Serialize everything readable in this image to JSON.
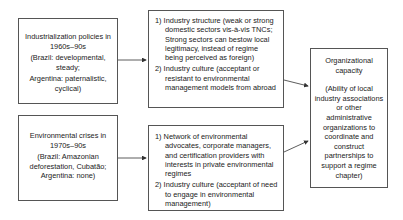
{
  "diagram": {
    "box_industrialization": {
      "title": "Industrialization policies in 1960s–90s",
      "detail_1": "(Brazil: developmental, steady;",
      "detail_2": "Argentina: paternalistic, cyclical)"
    },
    "box_environmental": {
      "title": "Environmental crises in 1970s–90s",
      "detail_1": "(Brazil: Amazonian deforestation, Cubatão;",
      "detail_2": "Argentina: none)"
    },
    "box_industry_structure": {
      "item1": "1) Industry structure (weak or strong domestic sectors vis-à-vis TNCs; Strong sectors can bestow local legitimacy, instead of regime being perceived as foreign)",
      "item2": "2) Industry culture (acceptant or resistant to environmental management models from abroad"
    },
    "box_network": {
      "item1": "1) Network of environmental advocates, corporate managers, and certification providers with interests in private environmental regimes",
      "item2": "2) Industry culture (acceptant of need to engage in environmental management)"
    },
    "box_capacity": {
      "title": "Organizational capacity",
      "detail": "(Ability of local industry associations or other administrative organizations to coordinate and construct partnerships to support a regime chapter)"
    },
    "colors": {
      "border": "#555555",
      "text": "#222222",
      "arrow": "#333333"
    }
  }
}
